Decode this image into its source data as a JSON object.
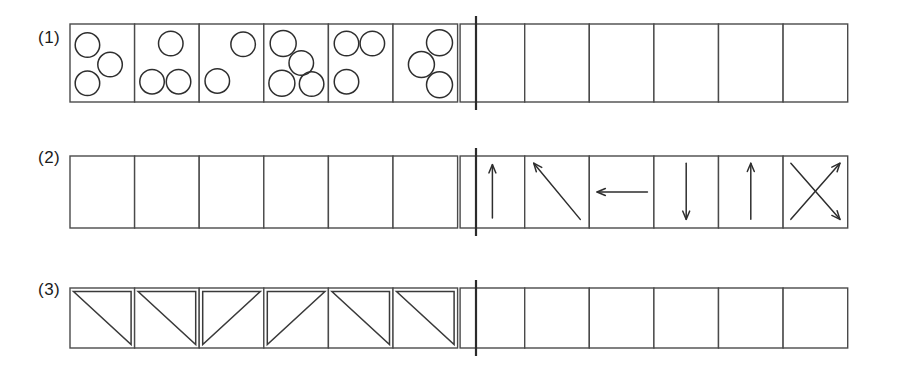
{
  "page": {
    "background_color": "#ffffff",
    "ink_color": "#2e2e2e",
    "grid_line_color": "#4a4a4a",
    "divider_color": "#2b2b2b"
  },
  "layout": {
    "rows": 3,
    "cells_per_half": 6,
    "halves": 2,
    "label_column_x": 42,
    "grid_left": 70,
    "grid_right": 846,
    "cell_width": 64.6,
    "divider_x": 476
  },
  "rows": [
    {
      "label": "(1)",
      "label_x": 42,
      "label_y": 44,
      "top": 24,
      "height": 78,
      "left_half_content": "circle-groups",
      "right_half_content": "empty",
      "cells": [
        {
          "index": 0,
          "filled": true,
          "type": "circles",
          "count": 3,
          "circles": [
            {
              "cx": 0.27,
              "cy": 0.27,
              "r": 0.165
            },
            {
              "cx": 0.62,
              "cy": 0.52,
              "r": 0.165
            },
            {
              "cx": 0.27,
              "cy": 0.76,
              "r": 0.165
            }
          ]
        },
        {
          "index": 1,
          "filled": true,
          "type": "circles",
          "count": 3,
          "circles": [
            {
              "cx": 0.56,
              "cy": 0.25,
              "r": 0.165
            },
            {
              "cx": 0.27,
              "cy": 0.74,
              "r": 0.165
            },
            {
              "cx": 0.68,
              "cy": 0.74,
              "r": 0.165
            }
          ]
        },
        {
          "index": 2,
          "filled": true,
          "type": "circles",
          "count": 2,
          "circles": [
            {
              "cx": 0.68,
              "cy": 0.26,
              "r": 0.165
            },
            {
              "cx": 0.28,
              "cy": 0.73,
              "r": 0.165
            }
          ]
        },
        {
          "index": 3,
          "filled": true,
          "type": "circles",
          "count": 4,
          "circles": [
            {
              "cx": 0.3,
              "cy": 0.25,
              "r": 0.175
            },
            {
              "cx": 0.58,
              "cy": 0.5,
              "r": 0.165
            },
            {
              "cx": 0.28,
              "cy": 0.76,
              "r": 0.175
            },
            {
              "cx": 0.74,
              "cy": 0.77,
              "r": 0.165
            }
          ]
        },
        {
          "index": 4,
          "filled": true,
          "type": "circles",
          "count": 3,
          "circles": [
            {
              "cx": 0.28,
              "cy": 0.25,
              "r": 0.165
            },
            {
              "cx": 0.68,
              "cy": 0.25,
              "r": 0.165
            },
            {
              "cx": 0.28,
              "cy": 0.74,
              "r": 0.165
            }
          ]
        },
        {
          "index": 5,
          "filled": true,
          "type": "circles",
          "count": 3,
          "circles": [
            {
              "cx": 0.72,
              "cy": 0.24,
              "r": 0.175
            },
            {
              "cx": 0.44,
              "cy": 0.52,
              "r": 0.175
            },
            {
              "cx": 0.72,
              "cy": 0.78,
              "r": 0.175
            }
          ]
        },
        {
          "index": 6,
          "filled": false,
          "type": "empty"
        },
        {
          "index": 7,
          "filled": false,
          "type": "empty"
        },
        {
          "index": 8,
          "filled": false,
          "type": "empty"
        },
        {
          "index": 9,
          "filled": false,
          "type": "empty"
        },
        {
          "index": 10,
          "filled": false,
          "type": "empty"
        },
        {
          "index": 11,
          "filled": false,
          "type": "empty"
        }
      ]
    },
    {
      "label": "(2)",
      "label_x": 42,
      "label_y": 160,
      "top": 160,
      "height": 72,
      "left_half_content": "empty",
      "right_half_content": "arrows",
      "cells": [
        {
          "index": 0,
          "filled": false,
          "type": "empty"
        },
        {
          "index": 1,
          "filled": false,
          "type": "empty"
        },
        {
          "index": 2,
          "filled": false,
          "type": "empty"
        },
        {
          "index": 3,
          "filled": false,
          "type": "empty"
        },
        {
          "index": 4,
          "filled": false,
          "type": "empty"
        },
        {
          "index": 5,
          "filled": false,
          "type": "empty"
        },
        {
          "index": 6,
          "filled": true,
          "type": "arrows",
          "direction_name": "up",
          "arrows": [
            {
              "x1": 0.5,
              "y1": 0.86,
              "x2": 0.5,
              "y2": 0.12
            }
          ]
        },
        {
          "index": 7,
          "filled": true,
          "type": "arrows",
          "direction_name": "up-left-diagonal",
          "arrows": [
            {
              "x1": 0.86,
              "y1": 0.88,
              "x2": 0.14,
              "y2": 0.1
            }
          ]
        },
        {
          "index": 8,
          "filled": true,
          "type": "arrows",
          "direction_name": "left",
          "arrows": [
            {
              "x1": 0.9,
              "y1": 0.5,
              "x2": 0.12,
              "y2": 0.5
            }
          ]
        },
        {
          "index": 9,
          "filled": true,
          "type": "arrows",
          "direction_name": "down",
          "arrows": [
            {
              "x1": 0.5,
              "y1": 0.1,
              "x2": 0.5,
              "y2": 0.88
            }
          ]
        },
        {
          "index": 10,
          "filled": true,
          "type": "arrows",
          "direction_name": "up",
          "arrows": [
            {
              "x1": 0.5,
              "y1": 0.88,
              "x2": 0.5,
              "y2": 0.1
            }
          ]
        },
        {
          "index": 11,
          "filled": true,
          "type": "arrows",
          "direction_name": "cross-up-right-and-down-right",
          "arrows": [
            {
              "x1": 0.12,
              "y1": 0.88,
              "x2": 0.88,
              "y2": 0.1
            },
            {
              "x1": 0.12,
              "y1": 0.1,
              "x2": 0.88,
              "y2": 0.88
            }
          ]
        },
        {
          "index": 12,
          "filled": true,
          "type": "arrows",
          "direction_name": "down-left-diagonal",
          "arrows": [
            {
              "x1": 0.88,
              "y1": 0.1,
              "x2": 0.12,
              "y2": 0.88
            }
          ]
        }
      ]
    },
    {
      "label": "(3)",
      "label_x": 42,
      "label_y": 287,
      "top": 291,
      "height": 60,
      "left_half_content": "triangles",
      "right_half_content": "empty",
      "cells": [
        {
          "index": 0,
          "filled": true,
          "type": "triangle",
          "orientation": "upper-left",
          "hypotenuse": "top-left-to-bottom-right"
        },
        {
          "index": 1,
          "filled": true,
          "type": "triangle",
          "orientation": "upper-left",
          "hypotenuse": "top-left-to-bottom-right"
        },
        {
          "index": 2,
          "filled": true,
          "type": "triangle",
          "orientation": "upper-right",
          "hypotenuse": "bottom-left-to-top-right"
        },
        {
          "index": 3,
          "filled": true,
          "type": "triangle",
          "orientation": "upper-right",
          "hypotenuse": "bottom-left-to-top-right"
        },
        {
          "index": 4,
          "filled": true,
          "type": "triangle",
          "orientation": "upper-left",
          "hypotenuse": "top-left-to-bottom-right"
        },
        {
          "index": 5,
          "filled": true,
          "type": "triangle",
          "orientation": "upper-left",
          "hypotenuse": "top-left-to-bottom-right"
        },
        {
          "index": 6,
          "filled": false,
          "type": "empty"
        },
        {
          "index": 7,
          "filled": false,
          "type": "empty"
        },
        {
          "index": 8,
          "filled": false,
          "type": "empty"
        },
        {
          "index": 9,
          "filled": false,
          "type": "empty"
        },
        {
          "index": 10,
          "filled": false,
          "type": "empty"
        },
        {
          "index": 11,
          "filled": false,
          "type": "empty"
        }
      ]
    }
  ]
}
